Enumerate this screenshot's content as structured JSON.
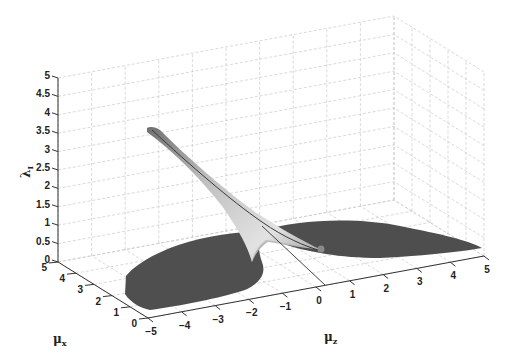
{
  "chart_data": {
    "type": "surface3d",
    "title": "",
    "xlabel": "μ_z",
    "ylabel": "μ_x",
    "zlabel": "λ_I",
    "x_axis": {
      "name": "mu_z",
      "range": [
        -5,
        5
      ],
      "ticks": [
        -5,
        -4,
        -3,
        -2,
        -1,
        0,
        1,
        2,
        3,
        4,
        5
      ]
    },
    "y_axis": {
      "name": "mu_x",
      "range": [
        0,
        5
      ],
      "ticks": [
        0,
        1,
        2,
        3,
        4,
        5
      ]
    },
    "z_axis": {
      "name": "lambda_I",
      "range": [
        0,
        5
      ],
      "ticks": [
        0,
        0.5,
        1,
        1.5,
        2,
        2.5,
        3,
        3.5,
        4,
        4.5,
        5
      ]
    },
    "grid": true,
    "colormap": "gray",
    "surface_description": "Two dark wings lying near λ_I≈0 extending toward μ_z=-5 and μ_z=+5 (largest near small μ_x), joined by a light-grey ridge that rises from μ_z≈0 up to λ_I≈3.6 at μ_z≈-5, μ_x≈5",
    "ridge_line": {
      "from": {
        "mu_z": 0,
        "mu_x": 0,
        "lambda": 0
      },
      "to": {
        "mu_z": -5,
        "mu_x": 5,
        "lambda": 3.6
      }
    },
    "marker_point": {
      "mu_z": 0.3,
      "mu_x": 1.2,
      "lambda": 0.2
    }
  },
  "labels": {
    "z_axis": "λ",
    "z_axis_sub": "I",
    "x_axis": "μ",
    "x_axis_sub": "x",
    "z_floor_axis": "μ",
    "z_floor_axis_sub": "z"
  },
  "tick_text": {
    "z": [
      "0",
      "0.5",
      "1",
      "1.5",
      "2",
      "2.5",
      "3",
      "3.5",
      "4",
      "4.5",
      "5"
    ],
    "mux": [
      "0",
      "1",
      "2",
      "3",
      "4",
      "5"
    ],
    "muz": [
      "−5",
      "−4",
      "−3",
      "−2",
      "−1",
      "0",
      "1",
      "2",
      "3",
      "4",
      "5"
    ]
  }
}
